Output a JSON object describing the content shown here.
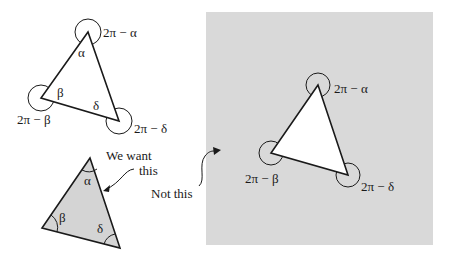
{
  "figure": {
    "colors": {
      "background": "#ffffff",
      "panel_gray": "#d9d9d9",
      "shaded_triangle": "#d4d4d4",
      "stroke": "#1a1a1a"
    },
    "top_left_triangle": {
      "interior_angles": {
        "alpha": "α",
        "beta": "β",
        "delta": "δ"
      },
      "exterior_labels": {
        "alpha": "2π − α",
        "beta": "2π − β",
        "delta": "2π − δ"
      }
    },
    "bottom_left_triangle": {
      "interior_angles": {
        "alpha": "α",
        "beta": "β",
        "delta": "δ"
      }
    },
    "right_panel_triangle": {
      "exterior_labels": {
        "alpha": "2π − α",
        "beta": "2π − β",
        "delta": "2π − δ"
      }
    },
    "annotations": {
      "we_want_line1": "We want",
      "we_want_line2": "this",
      "not_this": "Not this"
    }
  }
}
